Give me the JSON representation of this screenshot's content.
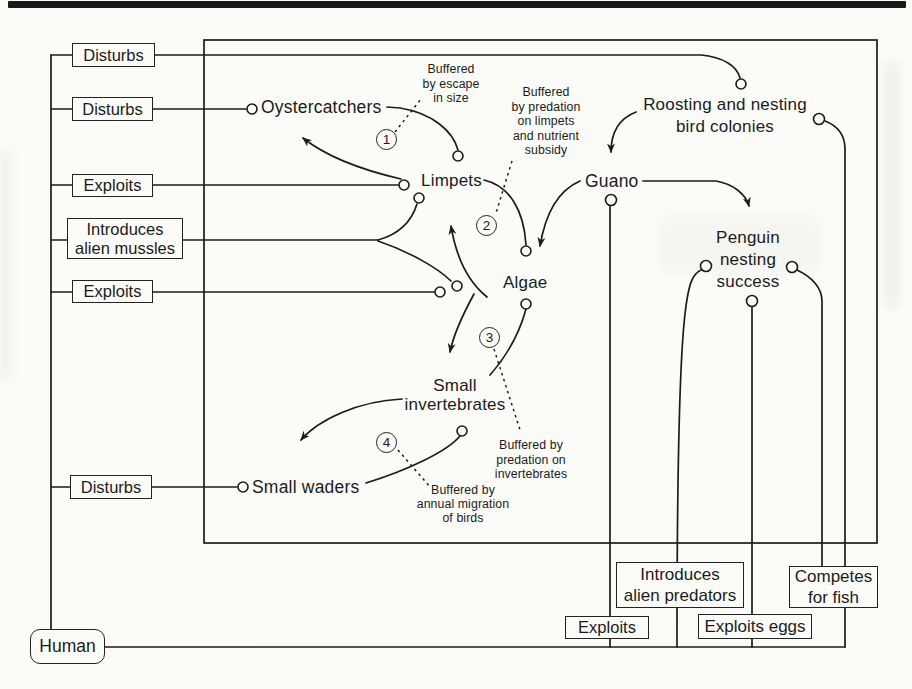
{
  "figure_type": "ecological interaction diagram (scanned book figure)",
  "left": {
    "disturbs_top": "Disturbs",
    "disturbs_birds": "Disturbs",
    "exploits_limpets": "Exploits",
    "introduces_mussels": "Introduces\nalien mussles",
    "exploits_algae": "Exploits",
    "disturbs_waders": "Disturbs"
  },
  "human": {
    "label": "Human"
  },
  "bottom": {
    "introduces_predators": "Introduces\nalien predators",
    "exploits_penguins": "Exploits",
    "exploits_eggs": "Exploits eggs",
    "competes_fish": "Competes\nfor fish"
  },
  "nodes": {
    "oystercatchers": "Oystercatchers",
    "limpets": "Limpets",
    "algae": "Algae",
    "small_invertebrates": "Small\ninvertebrates",
    "small_waders": "Small waders",
    "guano": "Guano",
    "roosting_colonies": "Roosting and nesting\nbird colonies",
    "penguin_nesting": "Penguin\nnesting\nsuccess"
  },
  "buffers": {
    "b1": {
      "num": "1",
      "text": "Buffered\nby escape\nin size"
    },
    "b2": {
      "num": "2",
      "text": "Buffered\nby predation\non limpets\nand nutrient\nsubsidy"
    },
    "b3": {
      "num": "3",
      "text": "Buffered by\npredation on\ninvertebrates"
    },
    "b4": {
      "num": "4",
      "text": "Buffered by\nannual migration\nof birds"
    }
  },
  "colors": {
    "ink": "#1c1c1c",
    "paper": "#fbfbf8"
  }
}
